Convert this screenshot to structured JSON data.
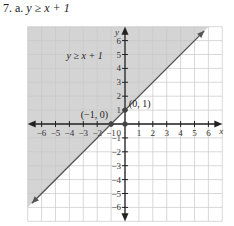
{
  "problem": {
    "number": "7.",
    "part": "a.",
    "inequality": "y ≥ x + 1"
  },
  "chart_data": {
    "type": "line",
    "title": "y ≥ x + 1",
    "xlabel": "x",
    "ylabel": "y",
    "xlim": [
      -7,
      7
    ],
    "ylim": [
      -7,
      7
    ],
    "grid": true,
    "x_ticks": [
      -6,
      -5,
      -4,
      -3,
      -2,
      -1,
      1,
      2,
      3,
      4,
      5,
      6
    ],
    "y_ticks": [
      -6,
      -5,
      -4,
      -3,
      -2,
      -1,
      1,
      2,
      3,
      4,
      5,
      6
    ],
    "origin_label": "0",
    "boundary_line": {
      "equation": "y = x + 1",
      "style": "solid",
      "slope": 1,
      "intercept": 1
    },
    "shaded_region": "above line (y ≥ x + 1)",
    "region_label": "y ≥ x + 1",
    "points": [
      {
        "x": -1,
        "y": 0,
        "label": "(−1, 0)"
      },
      {
        "x": 0,
        "y": 1,
        "label": "(0, 1)"
      },
      {
        "x": 0,
        "y": 0,
        "label": ""
      }
    ],
    "colors": {
      "shade": "#d4d4d4",
      "grid": "#c8c8c8",
      "line": "#555555",
      "axis": "#222222"
    }
  }
}
